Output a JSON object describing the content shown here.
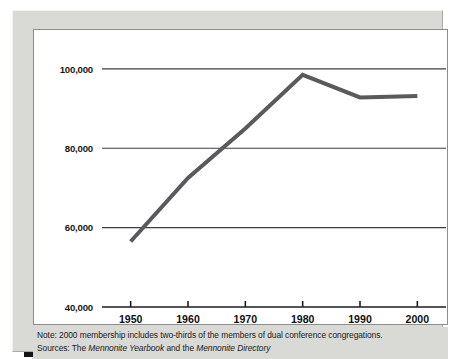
{
  "figure": {
    "frame_color": "#d9d9d5",
    "panel_color": "#ffffff",
    "shadow_color": "#151515"
  },
  "notes": {
    "note_prefix": "Note: 2000 membership includes two-thirds of the members of dual conference congregations.",
    "sources_prefix": "Sources: The ",
    "sources_title_1": "Mennonite Yearbook",
    "sources_middle": " and the ",
    "sources_title_2": "Mennonite Directory"
  },
  "chart_data": {
    "type": "line",
    "title": "",
    "subtitle": "",
    "xlabel": "",
    "ylabel": "",
    "x": [
      1950,
      1960,
      1970,
      1980,
      1990,
      2000
    ],
    "series": [
      {
        "name": "Membership",
        "values": [
          56500,
          72500,
          85000,
          98500,
          92800,
          93200
        ],
        "color": "#5a5a5c",
        "line_width": 4
      }
    ],
    "xlim": [
      1945,
      2005
    ],
    "ylim": [
      40000,
      103000
    ],
    "xticks": [
      1950,
      1960,
      1970,
      1980,
      1990,
      2000
    ],
    "xticklabels": [
      "1950",
      "1960",
      "1970",
      "1980",
      "1990",
      "2000"
    ],
    "yticks": [
      40000,
      60000,
      80000,
      100000
    ],
    "yticklabels": [
      "40,000",
      "60,000",
      "80,000",
      "100,000"
    ],
    "grid": true,
    "grid_axis": "y",
    "grid_color": "#3d3d3f",
    "legend": false,
    "legend_position": "none",
    "annotations": []
  }
}
